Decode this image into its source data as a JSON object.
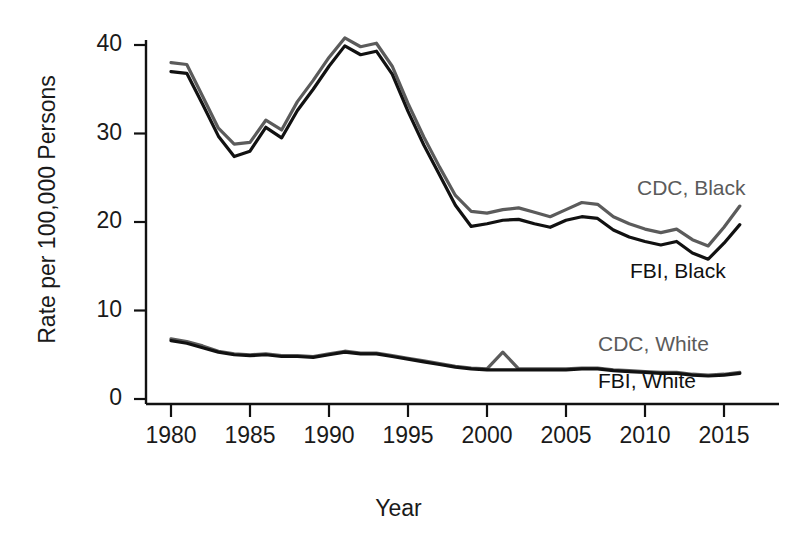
{
  "chart_data": {
    "type": "line",
    "title": "",
    "xlabel": "Year",
    "ylabel": "Rate per 100,000 Persons",
    "xlim": [
      1980,
      2016
    ],
    "ylim": [
      0,
      43
    ],
    "xticks": [
      1980,
      1985,
      1990,
      1995,
      2000,
      2005,
      2010,
      2015
    ],
    "yticks": [
      0,
      10,
      20,
      30,
      40
    ],
    "grid": false,
    "legend_position": "inline-right",
    "x": [
      1980,
      1981,
      1982,
      1983,
      1984,
      1985,
      1986,
      1987,
      1988,
      1989,
      1990,
      1991,
      1992,
      1993,
      1994,
      1995,
      1996,
      1997,
      1998,
      1999,
      2000,
      2001,
      2002,
      2003,
      2004,
      2005,
      2006,
      2007,
      2008,
      2009,
      2010,
      2011,
      2012,
      2013,
      2014,
      2015,
      2016
    ],
    "series": [
      {
        "name": "CDC, Black",
        "color": "#5b5b5b",
        "values": [
          38.0,
          37.8,
          34.2,
          30.6,
          28.8,
          29.0,
          31.5,
          30.4,
          33.6,
          36.0,
          38.6,
          40.8,
          39.8,
          40.2,
          37.6,
          33.4,
          29.6,
          26.2,
          23.0,
          21.2,
          21.0,
          21.4,
          21.6,
          21.1,
          20.6,
          21.4,
          22.2,
          22.0,
          20.6,
          19.8,
          19.2,
          18.8,
          19.2,
          18.0,
          17.3,
          19.4,
          21.8
        ]
      },
      {
        "name": "FBI, Black",
        "color": "#111111",
        "values": [
          37.0,
          36.8,
          33.3,
          29.7,
          27.4,
          28.0,
          30.7,
          29.5,
          32.6,
          35.0,
          37.6,
          39.9,
          38.9,
          39.3,
          36.7,
          32.5,
          28.7,
          25.3,
          21.9,
          19.5,
          19.8,
          20.2,
          20.3,
          19.8,
          19.4,
          20.2,
          20.6,
          20.4,
          19.1,
          18.3,
          17.8,
          17.4,
          17.8,
          16.5,
          15.8,
          17.6,
          19.7
        ]
      },
      {
        "name": "CDC, White",
        "color": "#5b5b5b",
        "values": [
          6.8,
          6.5,
          6.0,
          5.4,
          5.1,
          5.0,
          5.1,
          4.9,
          4.9,
          4.8,
          5.1,
          5.4,
          5.2,
          5.2,
          4.9,
          4.6,
          4.3,
          4.0,
          3.7,
          3.5,
          3.4,
          5.3,
          3.4,
          3.4,
          3.4,
          3.4,
          3.5,
          3.5,
          3.3,
          3.2,
          3.1,
          3.0,
          3.0,
          2.8,
          2.7,
          2.8,
          3.0
        ]
      },
      {
        "name": "FBI, White",
        "color": "#111111",
        "values": [
          6.6,
          6.3,
          5.8,
          5.3,
          5.0,
          4.9,
          5.0,
          4.8,
          4.8,
          4.7,
          5.0,
          5.3,
          5.1,
          5.1,
          4.8,
          4.5,
          4.2,
          3.9,
          3.6,
          3.4,
          3.3,
          3.3,
          3.3,
          3.3,
          3.3,
          3.3,
          3.4,
          3.4,
          3.2,
          3.1,
          3.0,
          2.9,
          2.9,
          2.7,
          2.6,
          2.7,
          2.9
        ]
      }
    ],
    "annotations": [
      {
        "text": "CDC, Black",
        "x": 637,
        "y": 176,
        "style": "cdc"
      },
      {
        "text": "FBI, Black",
        "x": 630,
        "y": 259,
        "style": "fbi"
      },
      {
        "text": "CDC, White",
        "x": 598,
        "y": 332,
        "style": "cdc"
      },
      {
        "text": "FBI, White",
        "x": 598,
        "y": 369,
        "style": "fbi"
      }
    ]
  },
  "axes": {
    "y_tick_labels": [
      "40",
      "30",
      "20",
      "10",
      "0"
    ],
    "x_tick_labels": [
      "1980",
      "1985",
      "1990",
      "1995",
      "2000",
      "2005",
      "2010",
      "2015"
    ],
    "y_title": "Rate per 100,000 Persons",
    "x_title": "Year"
  }
}
